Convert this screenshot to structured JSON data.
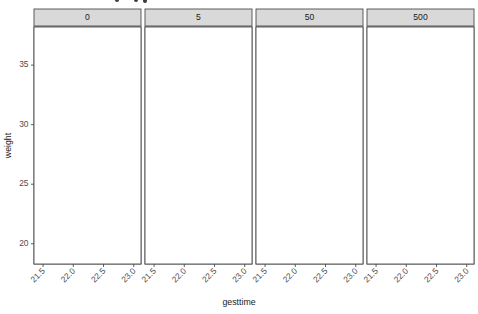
{
  "chart_data": {
    "type": "scatter",
    "title": "",
    "xlabel": "gesttime",
    "ylabel": "weight",
    "xlim": [
      21.35,
      23.12
    ],
    "ylim": [
      18.3,
      38.2
    ],
    "xticks": [
      21.5,
      22.0,
      22.5,
      23.0
    ],
    "xtick_labels": [
      "21.5",
      "22.0",
      "22.5",
      "23.0"
    ],
    "yticks": [
      20,
      25,
      30,
      35
    ],
    "ytick_labels": [
      "20",
      "25",
      "30",
      "35"
    ],
    "grid": true,
    "legend": "none",
    "facet_variable": "dose",
    "facet_layout": "1 row x 4 columns",
    "point_color": "#000000",
    "line_color": "#000000",
    "strip_fill": "#d9d9d9",
    "panel_fill": "#ffffff",
    "grid_color": "#ebebeb",
    "facets": [
      {
        "label": "0",
        "points": [
          {
            "x": 21.5,
            "y": 36.6
          },
          {
            "x": 21.5,
            "y": 32.7
          },
          {
            "x": 21.5,
            "y": 29.6
          },
          {
            "x": 21.5,
            "y": 28.8
          },
          {
            "x": 21.5,
            "y": 27.9
          },
          {
            "x": 22.0,
            "y": 36.2
          },
          {
            "x": 22.0,
            "y": 35.4
          },
          {
            "x": 22.0,
            "y": 33.4
          },
          {
            "x": 22.0,
            "y": 33.0
          },
          {
            "x": 22.0,
            "y": 30.9
          },
          {
            "x": 22.0,
            "y": 30.1
          },
          {
            "x": 22.5,
            "y": 34.0
          },
          {
            "x": 22.5,
            "y": 33.8
          },
          {
            "x": 22.5,
            "y": 32.5
          },
          {
            "x": 22.5,
            "y": 31.5
          },
          {
            "x": 22.5,
            "y": 27.8
          },
          {
            "x": 23.0,
            "y": 29.5
          }
        ],
        "fit": {
          "x1": 21.39,
          "y1": 29.9,
          "x2": 22.87,
          "y2": 35.2
        }
      },
      {
        "label": "5",
        "points": [
          {
            "x": 21.5,
            "y": 30.4
          },
          {
            "x": 21.5,
            "y": 27.0
          },
          {
            "x": 21.5,
            "y": 21.6
          },
          {
            "x": 21.5,
            "y": 20.1
          },
          {
            "x": 22.0,
            "y": 31.9
          },
          {
            "x": 22.0,
            "y": 31.4
          },
          {
            "x": 22.0,
            "y": 28.4
          },
          {
            "x": 22.0,
            "y": 27.1
          },
          {
            "x": 22.5,
            "y": 36.0
          },
          {
            "x": 22.5,
            "y": 34.6
          },
          {
            "x": 22.5,
            "y": 33.7
          },
          {
            "x": 22.5,
            "y": 33.1
          },
          {
            "x": 22.5,
            "y": 28.5
          },
          {
            "x": 22.5,
            "y": 27.1
          },
          {
            "x": 22.5,
            "y": 26.7
          },
          {
            "x": 22.5,
            "y": 25.0
          },
          {
            "x": 22.5,
            "y": 24.1
          },
          {
            "x": 23.05,
            "y": 37.6
          }
        ],
        "fit": {
          "x1": 21.39,
          "y1": 26.3,
          "x2": 22.87,
          "y2": 31.3
        }
      },
      {
        "label": "50",
        "points": [
          {
            "x": 21.5,
            "y": 35.9
          },
          {
            "x": 21.5,
            "y": 30.6
          },
          {
            "x": 21.5,
            "y": 30.1
          },
          {
            "x": 21.5,
            "y": 29.7
          },
          {
            "x": 21.5,
            "y": 28.7
          },
          {
            "x": 21.5,
            "y": 27.9
          },
          {
            "x": 21.5,
            "y": 24.0
          },
          {
            "x": 22.0,
            "y": 32.6
          },
          {
            "x": 22.0,
            "y": 31.8
          },
          {
            "x": 22.0,
            "y": 30.6
          },
          {
            "x": 22.0,
            "y": 28.6
          },
          {
            "x": 22.0,
            "y": 22.8
          },
          {
            "x": 22.5,
            "y": 36.9
          },
          {
            "x": 22.5,
            "y": 33.5
          },
          {
            "x": 22.5,
            "y": 30.8
          },
          {
            "x": 22.5,
            "y": 30.4
          }
        ],
        "fit": {
          "x1": 21.42,
          "y1": 28.5,
          "x2": 22.62,
          "y2": 31.9
        }
      },
      {
        "label": "500",
        "points": [
          {
            "x": 21.5,
            "y": 30.6
          },
          {
            "x": 21.5,
            "y": 27.0
          },
          {
            "x": 21.5,
            "y": 26.4
          },
          {
            "x": 22.0,
            "y": 34.1
          },
          {
            "x": 22.0,
            "y": 32.7
          },
          {
            "x": 22.0,
            "y": 32.2
          },
          {
            "x": 22.0,
            "y": 30.5
          },
          {
            "x": 22.0,
            "y": 25.9
          },
          {
            "x": 22.0,
            "y": 19.4
          },
          {
            "x": 22.5,
            "y": 34.4
          },
          {
            "x": 22.5,
            "y": 33.0
          },
          {
            "x": 22.5,
            "y": 32.5
          },
          {
            "x": 22.5,
            "y": 29.2
          },
          {
            "x": 22.5,
            "y": 27.1
          },
          {
            "x": 22.5,
            "y": 19.3
          },
          {
            "x": 23.05,
            "y": 37.7
          }
        ],
        "fit": {
          "x1": 21.39,
          "y1": 27.1,
          "x2": 22.93,
          "y2": 32.4
        }
      }
    ]
  },
  "axes": {
    "y_title": "weight",
    "x_title": "gesttime"
  }
}
